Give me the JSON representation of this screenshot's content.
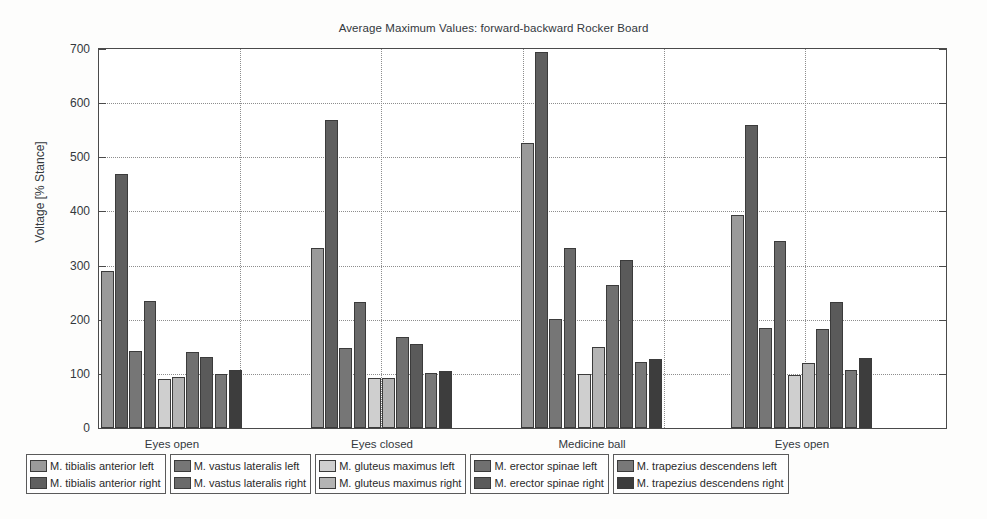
{
  "chart_data": {
    "type": "bar",
    "title": "Average Maximum Values: forward-backward Rocker Board",
    "xlabel": "",
    "ylabel": "Voltage [% Stance]",
    "ylim": [
      0,
      700
    ],
    "ytick_step": 100,
    "yticks": [
      "0",
      "100",
      "200",
      "300",
      "400",
      "500",
      "600",
      "700"
    ],
    "grid": true,
    "legend_position": "below-axes",
    "legend_columns": 5,
    "categories": [
      "Eyes open",
      "Eyes closed",
      "Medicine ball",
      "Eyes open"
    ],
    "series": [
      {
        "name": "M. tibialis anterior left",
        "color": "#9a9a9a",
        "values": [
          290,
          333,
          527,
          393
        ]
      },
      {
        "name": "M. tibialis anterior right",
        "color": "#5f5f5f",
        "values": [
          470,
          568,
          695,
          560
        ]
      },
      {
        "name": "M. vastus lateralis left",
        "color": "#767676",
        "values": [
          143,
          148,
          202,
          185
        ]
      },
      {
        "name": "M. vastus lateralis right",
        "color": "#6a6a6a",
        "values": [
          235,
          232,
          333,
          345
        ]
      },
      {
        "name": "M. gluteus maximus left",
        "color": "#cfcfcf",
        "values": [
          90,
          92,
          100,
          98
        ]
      },
      {
        "name": "M. gluteus maximus right",
        "color": "#b4b4b4",
        "values": [
          95,
          93,
          150,
          120
        ]
      },
      {
        "name": "M. erector spinae left",
        "color": "#707070",
        "values": [
          140,
          168,
          265,
          182
        ]
      },
      {
        "name": "M. erector spinae right",
        "color": "#5a5a5a",
        "values": [
          132,
          155,
          310,
          232
        ]
      },
      {
        "name": "M. trapezius descendens left",
        "color": "#787878",
        "values": [
          100,
          101,
          122,
          108
        ]
      },
      {
        "name": "M. trapezius descendens right",
        "color": "#3d3d3d",
        "values": [
          107,
          105,
          128,
          130
        ]
      }
    ]
  },
  "legend": {
    "columns": [
      {
        "rows": [
          {
            "label": "M. tibialis anterior left",
            "color": "#9a9a9a"
          },
          {
            "label": "M. tibialis anterior right",
            "color": "#5f5f5f"
          }
        ]
      },
      {
        "rows": [
          {
            "label": "M. vastus lateralis left",
            "color": "#767676"
          },
          {
            "label": "M. vastus lateralis right",
            "color": "#6a6a6a"
          }
        ]
      },
      {
        "rows": [
          {
            "label": "M. gluteus maximus left",
            "color": "#cfcfcf"
          },
          {
            "label": "M. gluteus maximus right",
            "color": "#b4b4b4"
          }
        ]
      },
      {
        "rows": [
          {
            "label": "M. erector spinae left",
            "color": "#707070"
          },
          {
            "label": "M. erector spinae right",
            "color": "#5a5a5a"
          }
        ]
      },
      {
        "rows": [
          {
            "label": "M. trapezius descendens left",
            "color": "#787878"
          },
          {
            "label": "M. trapezius descendens right",
            "color": "#3d3d3d"
          }
        ]
      }
    ]
  }
}
